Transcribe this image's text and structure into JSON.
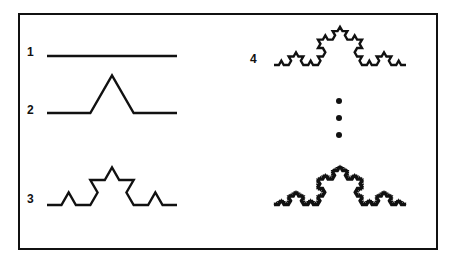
{
  "figure": {
    "border_color": "#111111",
    "stroke_color": "#111111",
    "background_color": "#ffffff",
    "width": 459,
    "height": 266
  },
  "labels": {
    "stage_1": "1",
    "stage_2": "2",
    "stage_3": "3",
    "stage_4": "4"
  },
  "ellipsis": {
    "name": "vertical-ellipsis",
    "dot_count": 3,
    "meaning": "continues indefinitely"
  },
  "chart_data": {
    "type": "line",
    "subtitle": "Successive iterations of the Koch (snowflake) generator applied to a straight segment",
    "xlabel": "",
    "ylabel": "",
    "grid": false,
    "legend": "none",
    "axis_ranges_note": "no axes drawn; each curve spans one unit of initiator length",
    "generator_rule": "replace each segment by 4 segments of 1/3 length with a 60-degree outward peak",
    "series": [
      {
        "name": "1",
        "label": "1",
        "iteration": 0,
        "segment_count": 1,
        "description": "initiator: straight horizontal segment",
        "span_px": 132,
        "height_px": 0
      },
      {
        "name": "2",
        "label": "2",
        "iteration": 1,
        "segment_count": 4,
        "description": "single outward triangular peak at the middle third",
        "span_px": 132,
        "height_px": 38
      },
      {
        "name": "3",
        "label": "3",
        "iteration": 2,
        "segment_count": 16,
        "description": "generator applied to each of the four segments",
        "span_px": 132,
        "height_px": 38
      },
      {
        "name": "4",
        "label": "4",
        "iteration": 3,
        "segment_count": 64,
        "description": "third iteration, visibly crinkled outline",
        "span_px": 134,
        "height_px": 38
      },
      {
        "name": "limit",
        "label": "",
        "iteration": 5,
        "segment_count": 1024,
        "description": "late iteration approaching the fractal limit curve",
        "span_px": 134,
        "height_px": 38
      }
    ]
  }
}
